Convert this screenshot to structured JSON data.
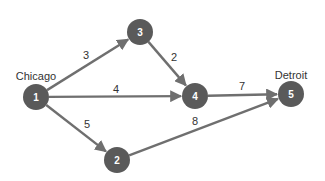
{
  "diagram": {
    "type": "directed-network",
    "colors": {
      "node": "#5a5a5a",
      "edge": "#6f6f6f",
      "text": "#333333",
      "node_text": "#ffffff"
    },
    "nodes": [
      {
        "id": "1",
        "label": "1",
        "city": "Chicago",
        "x": 36,
        "y": 97
      },
      {
        "id": "2",
        "label": "2",
        "city": "",
        "x": 117,
        "y": 160
      },
      {
        "id": "3",
        "label": "3",
        "city": "",
        "x": 140,
        "y": 32
      },
      {
        "id": "4",
        "label": "4",
        "city": "",
        "x": 195,
        "y": 96
      },
      {
        "id": "5",
        "label": "5",
        "city": "Detroit",
        "x": 291,
        "y": 94
      }
    ],
    "edges": [
      {
        "from": "1",
        "to": "3",
        "weight": "3",
        "lx": 86,
        "ly": 55
      },
      {
        "from": "1",
        "to": "4",
        "weight": "4",
        "lx": 116,
        "ly": 89
      },
      {
        "from": "1",
        "to": "2",
        "weight": "5",
        "lx": 87,
        "ly": 124
      },
      {
        "from": "3",
        "to": "4",
        "weight": "2",
        "lx": 174,
        "ly": 57
      },
      {
        "from": "4",
        "to": "5",
        "weight": "7",
        "lx": 242,
        "ly": 86
      },
      {
        "from": "2",
        "to": "5",
        "weight": "8",
        "lx": 195,
        "ly": 121
      }
    ],
    "labels": {
      "source": "Chicago",
      "sink": "Detroit"
    }
  }
}
